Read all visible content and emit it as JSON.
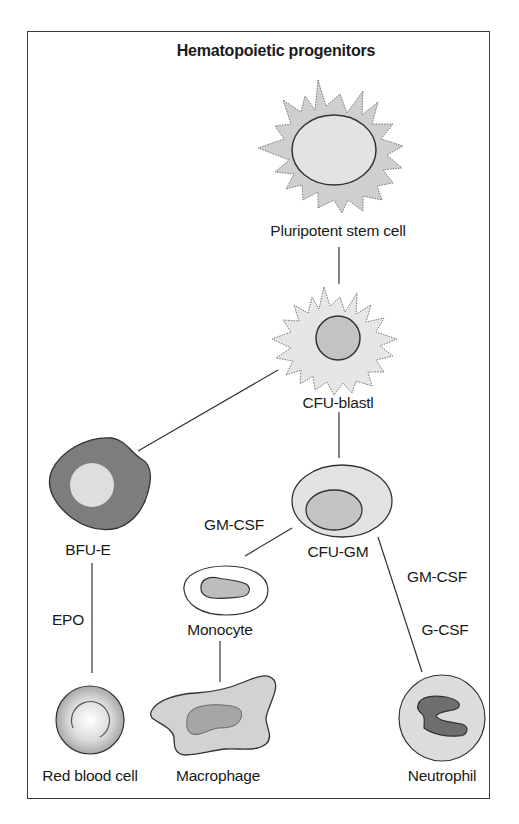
{
  "title": "Hematopoietic progenitors",
  "cells": {
    "pluripotent": {
      "label": "Pluripotent stem cell",
      "icon": "spiky-stem-cell"
    },
    "cfu_blast": {
      "label": "CFU-blastl",
      "icon": "spiky-blast-cell"
    },
    "bfu_e": {
      "label": "BFU-E",
      "icon": "blob-cell-dark"
    },
    "cfu_gm": {
      "label": "CFU-GM",
      "icon": "oval-cell"
    },
    "monocyte": {
      "label": "Monocyte",
      "icon": "oval-ring-cell"
    },
    "red_blood_cell": {
      "label": "Red blood cell",
      "icon": "sphere-cell"
    },
    "macrophage": {
      "label": "Macrophage",
      "icon": "amoeboid-cell"
    },
    "neutrophil": {
      "label": "Neutrophil",
      "icon": "lobed-nucleus-cell"
    }
  },
  "factors": {
    "epo": "EPO",
    "gm_csf_monocyte": "GM-CSF",
    "gm_csf_neutrophil": "GM-CSF",
    "g_csf": "G-CSF"
  },
  "colors": {
    "border": "#3a3a3a",
    "cell_light": "#e4e4e4",
    "cell_mid": "#cfcfcf",
    "cell_dark": "#7d7d7d",
    "nucleus_mid": "#bdbdbd",
    "nucleus_dark": "#6e6e6e"
  }
}
